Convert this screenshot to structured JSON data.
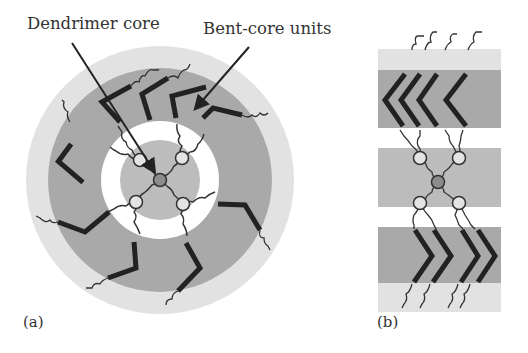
{
  "labels": {
    "dendrimer_core": "Dendrimer core",
    "bent_core_units": "Bent-core units",
    "panel_a": "(a)",
    "panel_b": "(b)"
  },
  "colors": {
    "outer_light": "#e2e2e2",
    "dark_band": "#a9a9a9",
    "white_ring": "#ffffff",
    "inner_gray": "#bcbcbc",
    "core": "#8c8c8c",
    "bent_core": "#222222",
    "chain": "#333333"
  },
  "panel_a": {
    "center": [
      160,
      180
    ],
    "radii": {
      "outer": 134,
      "dark": 112,
      "white": 59,
      "inner": 40
    },
    "bent_core_units": 8,
    "branch_nodes": 4
  },
  "panel_b": {
    "x": 378,
    "width": 123,
    "bands": [
      {
        "y": 49,
        "h": 21,
        "type": "light"
      },
      {
        "y": 70,
        "h": 58,
        "type": "dark"
      },
      {
        "y": 128,
        "h": 20,
        "type": "white"
      },
      {
        "y": 148,
        "h": 59,
        "type": "inner"
      },
      {
        "y": 207,
        "h": 20,
        "type": "white"
      },
      {
        "y": 227,
        "h": 56,
        "type": "dark"
      },
      {
        "y": 283,
        "h": 29,
        "type": "light"
      }
    ]
  }
}
